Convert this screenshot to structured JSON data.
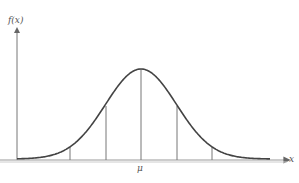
{
  "diagram": {
    "y_axis_label": "f(x)",
    "x_axis_label": "x",
    "mean_label": "μ",
    "vertical_lines_sigma": [
      -2,
      -1,
      0,
      1,
      2
    ],
    "colors": {
      "curve": "#444444",
      "axis": "#888888",
      "lines": "#777777"
    }
  }
}
